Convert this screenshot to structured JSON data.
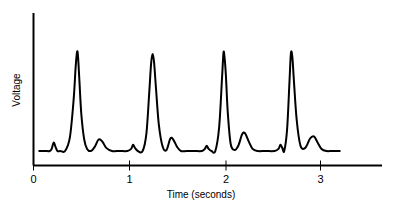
{
  "chart_data": {
    "type": "line",
    "title": "",
    "subtitle": "",
    "xlabel": "Time (seconds)",
    "ylabel": "Voltage",
    "xlim": [
      0,
      3.65
    ],
    "ylim": [
      0,
      1.12
    ],
    "xticks": [
      0,
      1,
      2,
      3
    ],
    "xtick_labels": [
      "0",
      "1",
      "2",
      "3"
    ],
    "yticks": [],
    "ytick_labels": [],
    "grid": false,
    "legend": null,
    "annotations": [],
    "series": [
      {
        "name": "ECG voltage trace",
        "color": "#000000",
        "linewidth": 2,
        "description": "Electrocardiogram showing four heartbeat cycles, each with a small P wave, a tall narrow R spike, and a rounded T wave.",
        "baseline": 0.05,
        "beats": [
          {
            "p_time": 0.21,
            "p_height": 0.13,
            "r_time": 0.46,
            "r_height": 1.0,
            "t_time": 0.68,
            "t_height": 0.16
          },
          {
            "p_time": 1.04,
            "p_height": 0.11,
            "r_time": 1.24,
            "r_height": 0.98,
            "t_time": 1.45,
            "t_height": 0.17
          },
          {
            "p_time": 1.8,
            "p_height": 0.1,
            "r_time": 1.99,
            "r_height": 0.99,
            "t_time": 2.2,
            "t_height": 0.22
          },
          {
            "p_time": 2.58,
            "p_height": 0.11,
            "r_time": 2.69,
            "r_height": 0.99,
            "t_time": 2.95,
            "t_height": 0.19
          }
        ],
        "x": [
          0.06,
          0.12,
          0.17,
          0.19,
          0.21,
          0.23,
          0.25,
          0.28,
          0.33,
          0.38,
          0.42,
          0.44,
          0.455,
          0.465,
          0.48,
          0.5,
          0.53,
          0.56,
          0.6,
          0.64,
          0.68,
          0.72,
          0.76,
          0.82,
          0.9,
          0.98,
          1.02,
          1.04,
          1.06,
          1.09,
          1.14,
          1.18,
          1.21,
          1.23,
          1.245,
          1.26,
          1.28,
          1.31,
          1.35,
          1.39,
          1.43,
          1.46,
          1.5,
          1.54,
          1.6,
          1.68,
          1.76,
          1.79,
          1.81,
          1.83,
          1.86,
          1.9,
          1.94,
          1.97,
          1.985,
          1.995,
          2.01,
          2.03,
          2.06,
          2.1,
          2.14,
          2.18,
          2.21,
          2.25,
          2.29,
          2.34,
          2.42,
          2.52,
          2.56,
          2.58,
          2.6,
          2.62,
          2.65,
          2.675,
          2.69,
          2.705,
          2.72,
          2.75,
          2.79,
          2.84,
          2.89,
          2.93,
          2.97,
          3.01,
          3.06,
          3.12,
          3.2
        ],
        "y": [
          0.05,
          0.05,
          0.05,
          0.07,
          0.13,
          0.09,
          0.05,
          0.05,
          0.05,
          0.18,
          0.55,
          0.85,
          1.0,
          0.96,
          0.72,
          0.4,
          0.16,
          0.07,
          0.05,
          0.09,
          0.16,
          0.14,
          0.08,
          0.05,
          0.05,
          0.05,
          0.07,
          0.11,
          0.08,
          0.05,
          0.05,
          0.22,
          0.62,
          0.9,
          0.98,
          0.9,
          0.65,
          0.3,
          0.09,
          0.06,
          0.17,
          0.16,
          0.09,
          0.05,
          0.05,
          0.05,
          0.05,
          0.07,
          0.1,
          0.07,
          0.05,
          0.05,
          0.28,
          0.75,
          0.99,
          0.96,
          0.78,
          0.42,
          0.12,
          0.06,
          0.1,
          0.21,
          0.22,
          0.14,
          0.07,
          0.05,
          0.05,
          0.05,
          0.07,
          0.11,
          0.08,
          0.05,
          0.26,
          0.72,
          0.99,
          0.95,
          0.74,
          0.35,
          0.1,
          0.08,
          0.17,
          0.19,
          0.13,
          0.07,
          0.05,
          0.05,
          0.05
        ]
      }
    ]
  },
  "axes": {
    "x_axis_label": "Time (seconds)",
    "y_axis_label": "Voltage",
    "x_tick_0": "0",
    "x_tick_1": "1",
    "x_tick_2": "2",
    "x_tick_3": "3"
  },
  "colors": {
    "background": "#ffffff",
    "foreground": "#000000",
    "trace": "#000000"
  }
}
